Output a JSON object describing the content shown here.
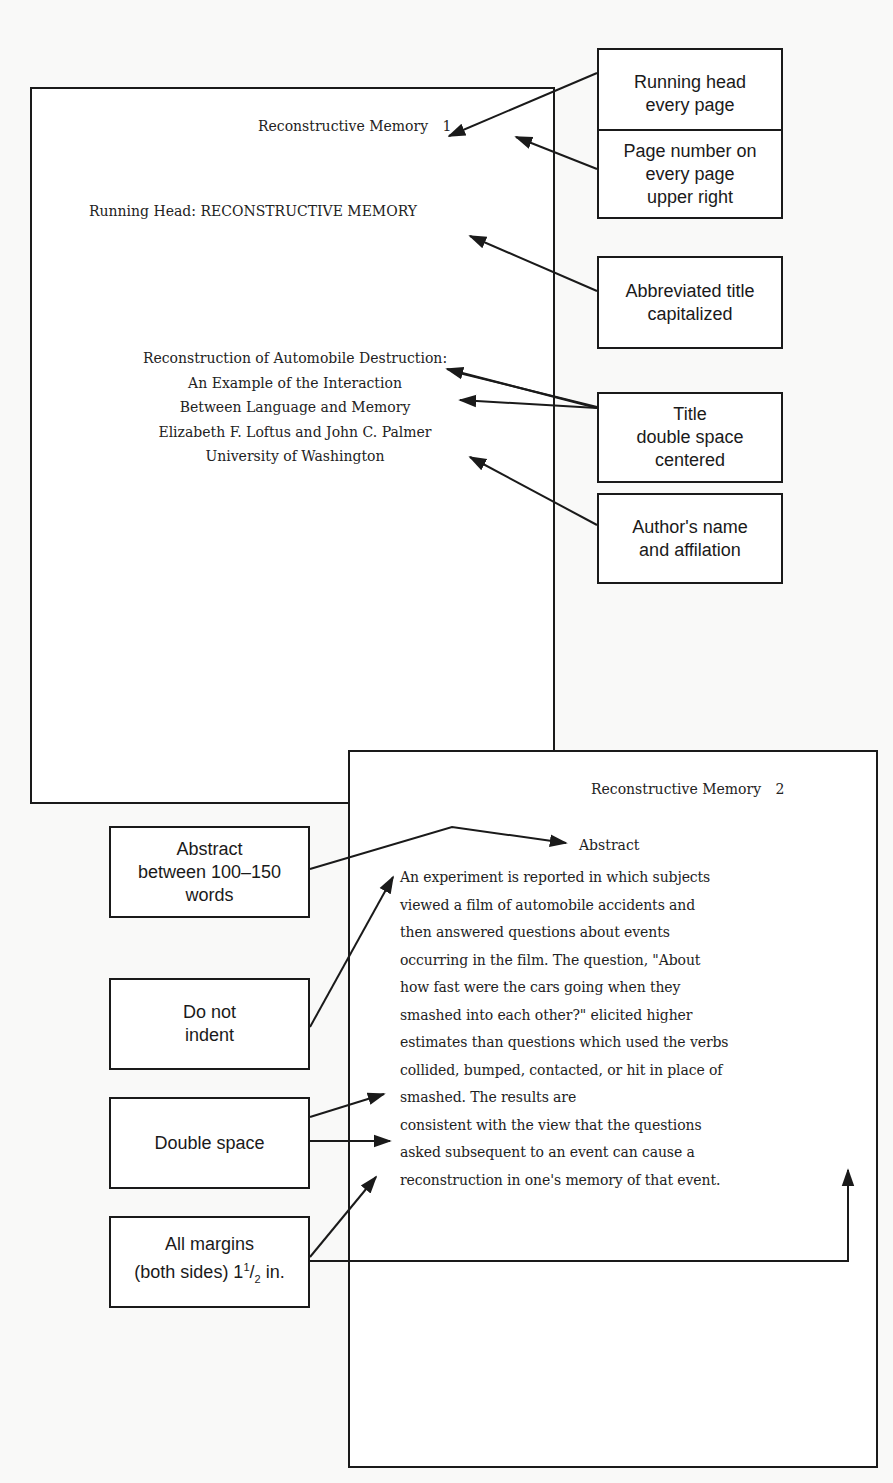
{
  "page1": {
    "running_head": "Reconstructive Memory",
    "page_number": "1",
    "running_head_label": "Running Head: RECONSTRUCTIVE MEMORY",
    "title_lines": [
      "Reconstruction of Automobile Destruction:",
      "An Example of the Interaction",
      "Between Language and Memory"
    ],
    "authors": "Elizabeth F. Loftus and John C. Palmer",
    "affiliation": "University of Washington"
  },
  "page2": {
    "running_head": "Reconstructive Memory",
    "page_number": "2",
    "abstract_heading": "Abstract",
    "abstract_lines": [
      "An experiment is reported in which subjects",
      "viewed a film of automobile accidents and",
      "then answered questions about events",
      "occurring in the film. The question, \"About",
      "how fast were the cars going when they",
      "smashed into each other?\" elicited higher",
      "estimates than questions which used the verbs",
      "collided, bumped, contacted, or hit in place of",
      "smashed. The results are",
      "consistent with the view that the questions",
      "asked subsequent to an event can cause a",
      "reconstruction in one's memory of that event."
    ]
  },
  "callouts": {
    "running_head": "Running head\nevery page",
    "page_number": "Page number on\nevery page\nupper right",
    "abbreviated_title": "Abbreviated title\ncapitalized",
    "title": "Title\ndouble space\ncentered",
    "author": "Author's name\nand affilation",
    "abstract": "Abstract\nbetween 100–150\nwords",
    "no_indent": "Do not\nindent",
    "double_space": "Double space",
    "margins_prefix": "All margins\n(both sides) 1",
    "margins_sup": "1",
    "margins_sub": "2",
    "margins_suffix": " in."
  }
}
